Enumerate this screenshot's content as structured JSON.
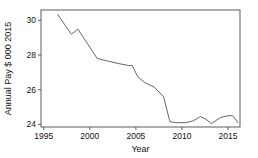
{
  "chart_data": {
    "type": "line",
    "title": "",
    "xlabel": "Year",
    "ylabel": "Annual Pay $ 000 2015",
    "xlim": [
      1994.7,
      2016.3
    ],
    "ylim": [
      23.85,
      30.6
    ],
    "xticks": [
      1995,
      2000,
      2005,
      2010,
      2015
    ],
    "xtick_labels": [
      "1995",
      "2000",
      "2005",
      "2010",
      "2015"
    ],
    "yticks": [
      24,
      26,
      28,
      30
    ],
    "ytick_labels": [
      "24",
      "26",
      "28",
      "30"
    ],
    "grid": false,
    "legend": false,
    "line_color": "#555555",
    "series": [
      {
        "name": "Annual Pay",
        "x": [
          1996.5,
          1998.0,
          1998.7,
          2000.8,
          2002.0,
          2003.2,
          2004.2,
          2004.6,
          2005.2,
          2006.0,
          2007.0,
          2008.0,
          2008.7,
          2009.4,
          2010.4,
          2011.2,
          2012.0,
          2012.6,
          2013.2,
          2014.2,
          2015.0,
          2015.5,
          2016.1
        ],
        "y": [
          30.35,
          29.2,
          29.5,
          27.8,
          27.65,
          27.5,
          27.4,
          27.4,
          26.75,
          26.4,
          26.15,
          25.6,
          24.15,
          24.1,
          24.1,
          24.2,
          24.45,
          24.3,
          24.05,
          24.4,
          24.5,
          24.5,
          24.1
        ]
      }
    ]
  },
  "labels": {
    "x_axis_title": "Year",
    "y_axis_title": "Annual Pay $ 000 2015"
  }
}
